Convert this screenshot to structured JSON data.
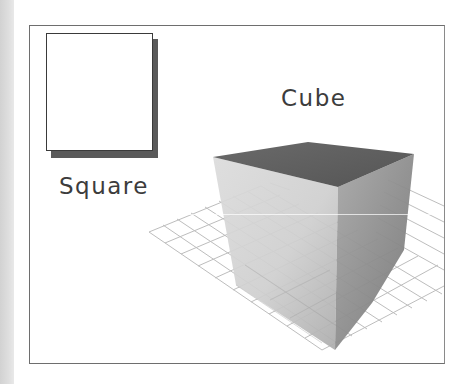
{
  "figure": {
    "labels": {
      "square": "Square",
      "cube": "Cube"
    },
    "shapes": [
      {
        "name": "square",
        "kind": "2D",
        "style": "white square with drop shadow"
      },
      {
        "name": "cube",
        "kind": "3D",
        "style": "shaded cube on perspective grid"
      }
    ],
    "colors": {
      "frame_border": "#6e6e6e",
      "square_fill": "#ffffff",
      "square_shadow": "#5a5a5a",
      "cube_top": "#5e5e5e",
      "cube_left_face_light": "#d8d8d8",
      "cube_left_face_dark": "#b4b4b4",
      "cube_right_face_light": "#9a9a9a",
      "cube_right_face_dark": "#7e7e7e",
      "grid_line": "#bdbdbd",
      "text": "#3c3c3c"
    }
  }
}
